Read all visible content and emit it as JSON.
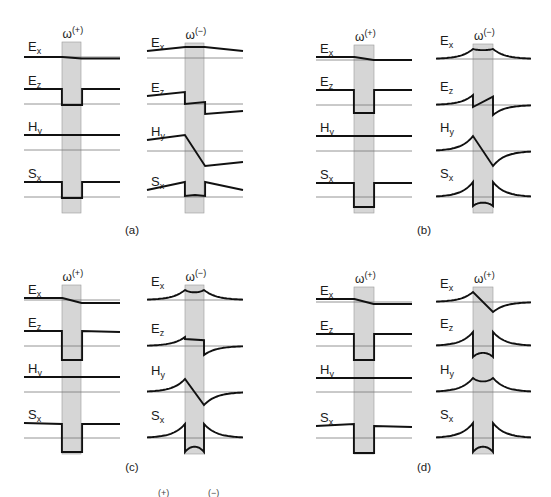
{
  "figure": {
    "colors": {
      "curve": "#111111",
      "axis": "#7a7a7a",
      "shade": "#d6d6d6"
    },
    "row_labels": [
      {
        "main": "E",
        "sub": "x"
      },
      {
        "main": "E",
        "sub": "z"
      },
      {
        "main": "H",
        "sub": "y"
      },
      {
        "main": "S",
        "sub": "x"
      }
    ],
    "panels": [
      {
        "tag": "(a)",
        "tag_pos": [
          132,
          234
        ],
        "columns": [
          {
            "x0": 24,
            "x1": 120,
            "s0": 62,
            "s1": 81,
            "omega": "ω",
            "sup": "(+)",
            "rows": [
              {
                "y": 57,
                "pts": [
                  [
                    0,
                    0
                  ],
                  [
                    0.4,
                    0
                  ],
                  [
                    0.6,
                    -1.5
                  ],
                  [
                    1,
                    -1.5
                  ]
                ],
                "shape": "line"
              },
              {
                "y": 104,
                "pts": [
                  [
                    0,
                    15
                  ],
                  [
                    0.395,
                    15
                  ],
                  [
                    0.395,
                    -1
                  ],
                  [
                    0.605,
                    -1
                  ],
                  [
                    0.605,
                    15
                  ],
                  [
                    1,
                    15
                  ]
                ],
                "shape": "line"
              },
              {
                "y": 150,
                "pts": [
                  [
                    0,
                    15
                  ],
                  [
                    1,
                    15
                  ]
                ],
                "shape": "line"
              },
              {
                "y": 197,
                "pts": [
                  [
                    0,
                    15
                  ],
                  [
                    0.395,
                    15
                  ],
                  [
                    0.395,
                    -1
                  ],
                  [
                    0.605,
                    -1
                  ],
                  [
                    0.605,
                    15
                  ],
                  [
                    1,
                    15
                  ]
                ],
                "shape": "line"
              }
            ]
          },
          {
            "x0": 147,
            "x1": 243,
            "s0": 185,
            "s1": 204,
            "omega": "ω",
            "sup": "(−)",
            "rows": [
              {
                "y": 58,
                "pts": [
                  [
                    0,
                    7
                  ],
                  [
                    0.4,
                    11
                  ],
                  [
                    0.6,
                    11
                  ],
                  [
                    1,
                    7
                  ]
                ],
                "shape": "line"
              },
              {
                "y": 104,
                "pts": [
                  [
                    0,
                    8
                  ],
                  [
                    0.395,
                    12
                  ],
                  [
                    0.395,
                    0
                  ],
                  [
                    0.605,
                    2
                  ],
                  [
                    0.605,
                    -10
                  ],
                  [
                    1,
                    -7
                  ]
                ],
                "shape": "line"
              },
              {
                "y": 151,
                "pts": [
                  [
                    0,
                    11
                  ],
                  [
                    0.395,
                    16
                  ],
                  [
                    0.605,
                    -15
                  ],
                  [
                    1,
                    -11
                  ]
                ],
                "shape": "line"
              },
              {
                "y": 197,
                "pts": [
                  [
                    0,
                    7
                  ],
                  [
                    0.395,
                    15
                  ],
                  [
                    0.395,
                    1
                  ],
                  [
                    0.5,
                    2
                  ],
                  [
                    0.605,
                    1
                  ],
                  [
                    0.605,
                    15
                  ],
                  [
                    1,
                    7
                  ]
                ],
                "shape": "line"
              }
            ]
          }
        ]
      },
      {
        "tag": "(b)",
        "tag_pos": [
          424,
          234
        ],
        "columns": [
          {
            "x0": 316,
            "x1": 412,
            "s0": 354,
            "s1": 374,
            "omega": "ω",
            "sup": "(+)",
            "rows": [
              {
                "y": 60,
                "pts": [
                  [
                    0,
                    3
                  ],
                  [
                    0.4,
                    3
                  ],
                  [
                    0.6,
                    0
                  ],
                  [
                    1,
                    0
                  ]
                ],
                "shape": "line"
              },
              {
                "y": 105,
                "pts": [
                  [
                    0,
                    15
                  ],
                  [
                    0.395,
                    15
                  ],
                  [
                    0.395,
                    -8
                  ],
                  [
                    0.605,
                    -8
                  ],
                  [
                    0.605,
                    15
                  ],
                  [
                    1,
                    15
                  ]
                ],
                "shape": "line"
              },
              {
                "y": 151,
                "pts": [
                  [
                    0,
                    15
                  ],
                  [
                    1,
                    15
                  ]
                ],
                "shape": "line"
              },
              {
                "y": 197,
                "pts": [
                  [
                    0,
                    14
                  ],
                  [
                    0.395,
                    14
                  ],
                  [
                    0.395,
                    -10
                  ],
                  [
                    0.605,
                    -10
                  ],
                  [
                    0.605,
                    14
                  ],
                  [
                    1,
                    14
                  ]
                ],
                "shape": "line"
              }
            ]
          },
          {
            "x0": 436,
            "x1": 531,
            "s0": 473,
            "s1": 493,
            "omega": "ω",
            "sup": "(−)",
            "rows": [
              {
                "y": 59,
                "shape": "bump-sym",
                "edge": 10,
                "mid": 8,
                "tail": 1
              },
              {
                "y": 105,
                "shape": "anti-saw",
                "edge": 10,
                "jump": 8
              },
              {
                "y": 151,
                "shape": "anti-diag",
                "edge": 15
              },
              {
                "y": 197,
                "shape": "sx-cusp",
                "edge": 15,
                "inner": -9
              }
            ]
          }
        ]
      },
      {
        "tag": "(c)",
        "tag_pos": [
          132,
          471
        ],
        "columns": [
          {
            "x0": 24,
            "x1": 120,
            "s0": 62,
            "s1": 81,
            "omega": "ω",
            "sup": "(+)",
            "rows": [
              {
                "y": 300,
                "pts": [
                  [
                    0,
                    2
                  ],
                  [
                    0.4,
                    2
                  ],
                  [
                    0.6,
                    -3
                  ],
                  [
                    1,
                    -3
                  ]
                ],
                "shape": "line"
              },
              {
                "y": 346,
                "pts": [
                  [
                    0,
                    15
                  ],
                  [
                    0.395,
                    15
                  ],
                  [
                    0.395,
                    -14
                  ],
                  [
                    0.605,
                    -14
                  ],
                  [
                    0.605,
                    15
                  ],
                  [
                    1,
                    14
                  ]
                ],
                "shape": "line"
              },
              {
                "y": 392,
                "pts": [
                  [
                    0,
                    15
                  ],
                  [
                    1,
                    15
                  ]
                ],
                "shape": "line"
              },
              {
                "y": 438,
                "pts": [
                  [
                    0,
                    15
                  ],
                  [
                    0.395,
                    14
                  ],
                  [
                    0.395,
                    -14
                  ],
                  [
                    0.605,
                    -14
                  ],
                  [
                    0.605,
                    14
                  ],
                  [
                    1,
                    14
                  ]
                ],
                "shape": "line"
              }
            ]
          },
          {
            "x0": 147,
            "x1": 243,
            "s0": 185,
            "s1": 204,
            "omega": "ω",
            "sup": "(−)",
            "rows": [
              {
                "y": 300,
                "shape": "bump-sym",
                "edge": 10,
                "mid": 6,
                "tail": 0
              },
              {
                "y": 346,
                "shape": "anti-saw",
                "edge": 9,
                "jump": 16
              },
              {
                "y": 392,
                "shape": "anti-diag",
                "edge": 13
              },
              {
                "y": 438,
                "shape": "sx-cusp",
                "edge": 14,
                "inner": -14
              }
            ]
          }
        ]
      },
      {
        "tag": "(d)",
        "tag_pos": [
          424,
          471
        ],
        "columns": [
          {
            "x0": 316,
            "x1": 412,
            "s0": 354,
            "s1": 374,
            "omega": "ω",
            "sup": "(+)",
            "rows": [
              {
                "y": 302,
                "pts": [
                  [
                    0,
                    3
                  ],
                  [
                    0.4,
                    3
                  ],
                  [
                    0.6,
                    -2
                  ],
                  [
                    1,
                    -2
                  ]
                ],
                "shape": "line"
              },
              {
                "y": 346,
                "pts": [
                  [
                    0,
                    12
                  ],
                  [
                    0.395,
                    12
                  ],
                  [
                    0.395,
                    -14
                  ],
                  [
                    0.605,
                    -14
                  ],
                  [
                    0.605,
                    12
                  ],
                  [
                    1,
                    12
                  ]
                ],
                "shape": "line"
              },
              {
                "y": 392,
                "pts": [
                  [
                    0,
                    14
                  ],
                  [
                    1,
                    14
                  ]
                ],
                "shape": "line"
              },
              {
                "y": 438,
                "pts": [
                  [
                    0,
                    12
                  ],
                  [
                    0.395,
                    14
                  ],
                  [
                    0.395,
                    -15
                  ],
                  [
                    0.605,
                    -15
                  ],
                  [
                    0.605,
                    12
                  ],
                  [
                    1,
                    11
                  ]
                ],
                "shape": "line"
              }
            ]
          },
          {
            "x0": 436,
            "x1": 531,
            "s0": 473,
            "s1": 493,
            "omega": "ω",
            "sup": "(+)",
            "rows": [
              {
                "y": 302,
                "shape": "anti-diag",
                "edge": 10
              },
              {
                "y": 346,
                "shape": "sx-cusp",
                "edge": 14,
                "inner": -11
              },
              {
                "y": 392,
                "shape": "bump-sym",
                "edge": 14,
                "mid": 8,
                "tail": 0
              },
              {
                "y": 438,
                "shape": "sx-cusp",
                "edge": 15,
                "inner": -14
              }
            ]
          }
        ]
      }
    ],
    "caption_fragment": {
      "parts": [
        "(+)",
        "(−)"
      ],
      "positions": [
        [
          158,
          496
        ],
        [
          208,
          496
        ]
      ]
    }
  }
}
